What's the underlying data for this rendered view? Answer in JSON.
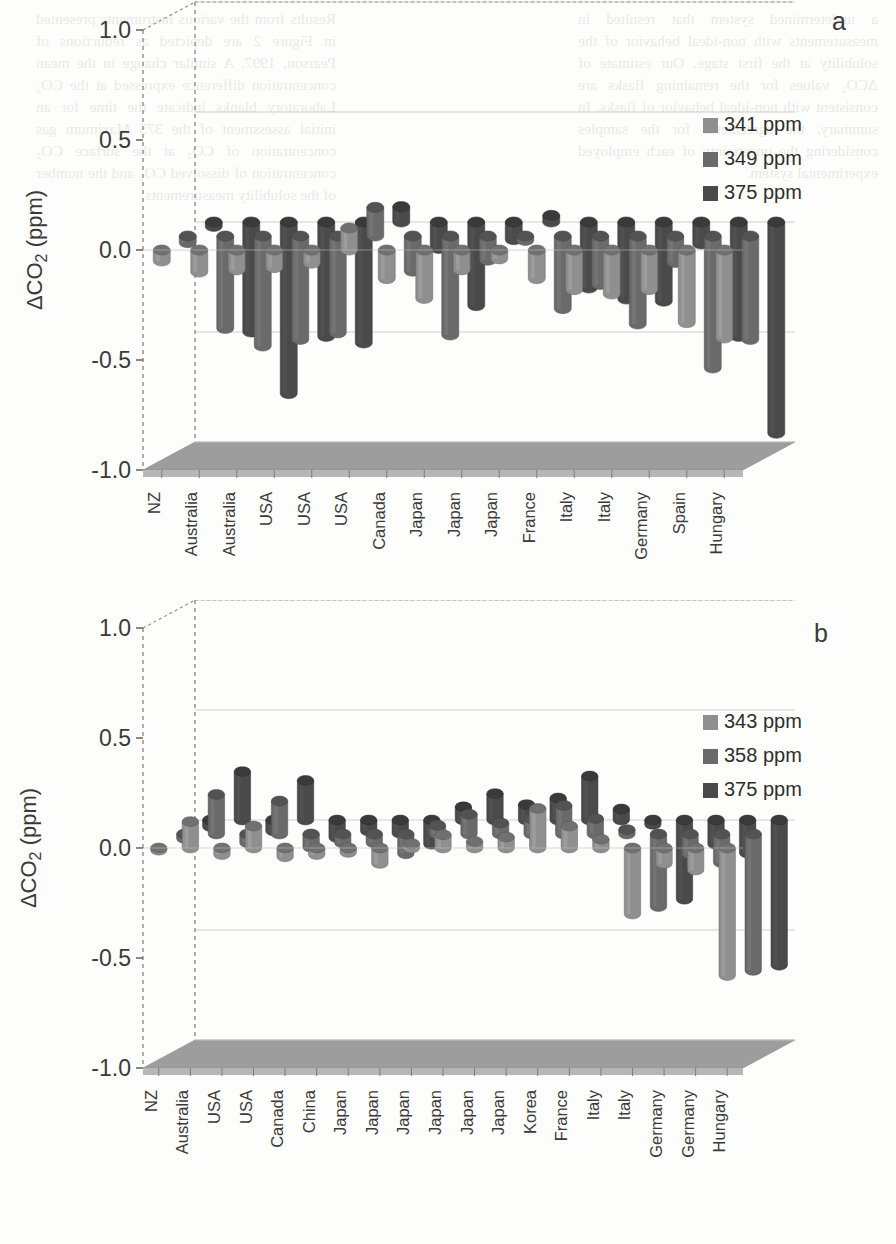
{
  "figure": {
    "axis_label": "ΔCO₂ (ppm)",
    "y_ticks": [
      "1.0",
      "0.5",
      "0.0",
      "-0.5",
      "-1.0"
    ],
    "y_values": [
      1.0,
      0.5,
      0.0,
      -0.5,
      -1.0
    ],
    "colors": {
      "series1": "#8f8f8f",
      "series2": "#6a6a6a",
      "series3": "#4a4a4a",
      "floor": "#9d9d9d",
      "axis": "#555555",
      "grid": "#c9c9c9"
    }
  },
  "panels": [
    {
      "id": "a",
      "letter": "a",
      "legend": [
        {
          "label": "341 ppm",
          "color": "#8f8f8f"
        },
        {
          "label": "349 ppm",
          "color": "#6a6a6a"
        },
        {
          "label": "375 ppm",
          "color": "#4a4a4a"
        }
      ]
    },
    {
      "id": "b",
      "letter": "b",
      "legend": [
        {
          "label": "343 ppm",
          "color": "#8f8f8f"
        },
        {
          "label": "358 ppm",
          "color": "#6a6a6a"
        },
        {
          "label": "375 ppm",
          "color": "#4a4a4a"
        }
      ]
    }
  ],
  "chart_data": [
    {
      "type": "bar",
      "title": "a",
      "xlabel": "",
      "ylabel": "ΔCO₂ (ppm)",
      "ylim": [
        -1.0,
        1.0
      ],
      "yticks": [
        -1.0,
        -0.5,
        0.0,
        0.5,
        1.0
      ],
      "grid": true,
      "legend_position": "top-right",
      "projection": "3d-cylinder",
      "categories": [
        "NZ",
        "Australia",
        "Australia",
        "USA",
        "USA",
        "USA",
        "Canada",
        "Japan",
        "Japan",
        "Japan",
        "France",
        "Italy",
        "Italy",
        "Germany",
        "Spain",
        "Hungary"
      ],
      "series": [
        {
          "name": "341 ppm",
          "color": "#8f8f8f",
          "values": [
            -0.05,
            -0.1,
            -0.09,
            -0.08,
            -0.06,
            0.1,
            -0.13,
            -0.22,
            -0.09,
            -0.04,
            -0.13,
            -0.18,
            -0.2,
            -0.18,
            -0.33,
            -0.4
          ]
        },
        {
          "name": "349 ppm",
          "color": "#6a6a6a",
          "values": [
            -0.03,
            -0.42,
            -0.5,
            -0.47,
            -0.44,
            0.13,
            -0.16,
            -0.45,
            -0.11,
            -0.02,
            -0.33,
            -0.22,
            -0.4,
            -0.12,
            -0.6,
            -0.47
          ]
        },
        {
          "name": "375 ppm",
          "color": "#4a4a4a",
          "values": [
            -0.02,
            -0.5,
            -0.78,
            -0.52,
            -0.55,
            0.07,
            -0.12,
            -0.38,
            -0.08,
            0.03,
            -0.3,
            -0.35,
            -0.36,
            -0.1,
            -0.52,
            -0.96
          ]
        }
      ]
    },
    {
      "type": "bar",
      "title": "b",
      "xlabel": "",
      "ylabel": "ΔCO₂ (ppm)",
      "ylim": [
        -1.0,
        1.0
      ],
      "yticks": [
        -1.0,
        -0.5,
        0.0,
        0.5,
        1.0
      ],
      "grid": true,
      "legend_position": "top-right",
      "projection": "3d-cylinder",
      "categories": [
        "NZ",
        "Australia",
        "USA",
        "USA",
        "Canada",
        "China",
        "Japan",
        "Japan",
        "Japan",
        "Japan",
        "Japan",
        "Japan",
        "Korea",
        "France",
        "Italy",
        "Italy",
        "Germany",
        "Germany",
        "Hungary"
      ],
      "series": [
        {
          "name": "343 ppm",
          "color": "#8f8f8f",
          "values": [
            -0.01,
            0.12,
            -0.03,
            0.1,
            -0.04,
            -0.03,
            -0.02,
            -0.07,
            0.02,
            0.06,
            0.03,
            0.05,
            0.18,
            0.1,
            0.04,
            -0.3,
            -0.07,
            -0.1,
            -0.58
          ]
        },
        {
          "name": "358 ppm",
          "color": "#6a6a6a",
          "values": [
            -0.02,
            0.18,
            -0.04,
            0.15,
            -0.06,
            -0.04,
            -0.04,
            -0.09,
            0.04,
            0.09,
            0.05,
            0.07,
            0.13,
            0.07,
            0.02,
            -0.33,
            -0.09,
            -0.13,
            -0.62
          ]
        },
        {
          "name": "375 ppm",
          "color": "#4a4a4a",
          "values": [
            -0.03,
            0.22,
            -0.05,
            0.18,
            -0.08,
            -0.05,
            -0.06,
            -0.11,
            0.06,
            0.12,
            0.07,
            0.1,
            0.2,
            0.05,
            -0.02,
            -0.36,
            -0.11,
            -0.15,
            -0.66
          ]
        }
      ]
    }
  ],
  "background_text": {
    "left_column": "a undetermined system that resulted in measurements with non-ideal behavior of the solubility at the first stage. Our estimate of ΔCO₂ values for the remaining flasks are consistent with non-ideal behavior of flasks. In summary, the agreements for the samples considering the uncertainty of each employed experimental system.",
    "right_column": "Results from the various instruments presented in Figure 2 are depicted as reductions of Pearson, 1997. A similar change in the mean concentration difference expressed at the CO₂ Laboratory blanks indicate the time for an initial assessment of the 375 Maximum gas concentration of CO₂ at the surface CO₂ concentration of dissolved CO₂ and the number of the solubility measurements."
  }
}
